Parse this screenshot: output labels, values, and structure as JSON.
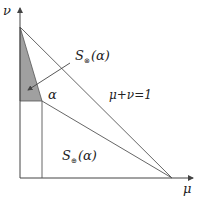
{
  "diagram": {
    "axes": {
      "x_label": "μ",
      "y_label": "ν"
    },
    "labels": {
      "upper_region": {
        "script": "S",
        "subscript": "⊗",
        "arg": "(α)"
      },
      "lower_region": {
        "script": "S",
        "subscript": "⊕",
        "arg": "(α)"
      },
      "alpha_point": "α",
      "line_equation": "μ+ν=1"
    },
    "colors": {
      "stroke": "#555555",
      "shaded_region": "#a0a0a0",
      "text": "#222222"
    }
  }
}
